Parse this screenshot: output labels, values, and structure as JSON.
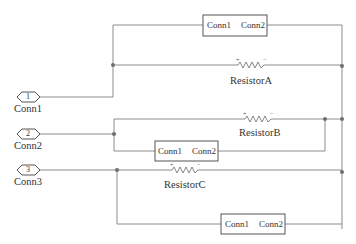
{
  "diagram": {
    "type": "electrical-schematic",
    "ports": [
      {
        "id": "1",
        "number": "1",
        "label": "Conn1"
      },
      {
        "id": "2",
        "number": "2",
        "label": "Conn2"
      },
      {
        "id": "3",
        "number": "3",
        "label": "Conn3"
      }
    ],
    "subsystem_blocks": [
      {
        "name": "block-top",
        "left_port": "Conn1",
        "right_port": "Conn2"
      },
      {
        "name": "block-middle",
        "left_port": "Conn1",
        "right_port": "Conn2"
      },
      {
        "name": "block-bottom",
        "left_port": "Conn1",
        "right_port": "Conn2"
      }
    ],
    "resistors": [
      {
        "name": "ResistorA",
        "plus": "+",
        "minus": "−"
      },
      {
        "name": "ResistorB",
        "plus": "+",
        "minus": "−"
      },
      {
        "name": "ResistorC",
        "plus": "+",
        "minus": "−"
      }
    ],
    "colors": {
      "wire": "#8c8c8c",
      "block_border": "#555555",
      "text": "#333333"
    }
  }
}
